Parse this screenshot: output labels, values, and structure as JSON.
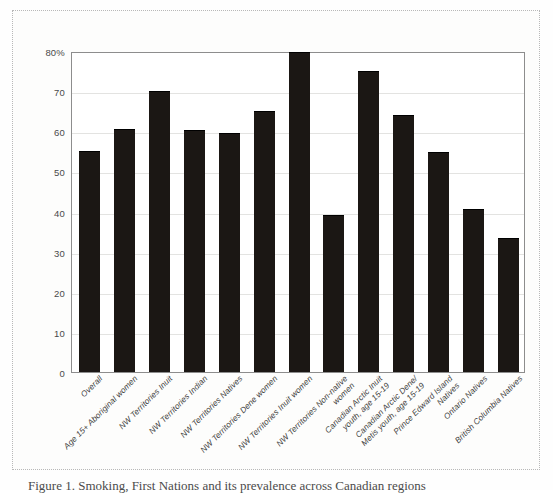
{
  "figure": {
    "caption": "Figure 1. Smoking, First Nations and its prevalence across Canadian regions"
  },
  "chart_data": {
    "type": "bar",
    "title": "",
    "xlabel": "",
    "ylabel": "",
    "ylim": [
      0,
      80
    ],
    "grid": true,
    "legend": "none",
    "bar_color": "#1b1714",
    "y_ticks": [
      0,
      10,
      20,
      30,
      40,
      50,
      60,
      70,
      80
    ],
    "y_tick_labels": [
      "0",
      "10",
      "20",
      "30",
      "40",
      "50",
      "60",
      "70",
      "80%"
    ],
    "categories": [
      "Overall",
      "Age 15+ Aboriginal women",
      "NW Territories Inuit",
      "NW Territories Indian",
      "NW Territories Natives",
      "NW Territories Dene women",
      "NW Territories Inuit women",
      "NW Territories Non-native women",
      "Canadian Arctic Inuit youth, age 15-19",
      "Canadian Arctic Dene/Metis youth, age 15-19",
      "Prince Edward Island Natives",
      "Ontario Natives",
      "British Columbia Natives"
    ],
    "category_lines": [
      [
        "Overall"
      ],
      [
        "Age 15+ Aboriginal women"
      ],
      [
        "NW Territories Inuit"
      ],
      [
        "NW Territories Indian"
      ],
      [
        "NW Territories Natives"
      ],
      [
        "NW Territories Dene women"
      ],
      [
        "NW Territories Inuit women"
      ],
      [
        "NW Territories Non-native",
        "women"
      ],
      [
        "Canadian Arctic Inuit",
        "youth, age 15-19"
      ],
      [
        "Canadian Arctic Dene/",
        "Metis youth, age 15-19"
      ],
      [
        "Prince Edward Island",
        "Natives"
      ],
      [
        "Ontario Natives"
      ],
      [
        "British Columbia Natives"
      ]
    ],
    "values": [
      54.9,
      60.3,
      69.8,
      60.0,
      59.4,
      64.7,
      79.5,
      39.0,
      74.7,
      63.8,
      54.7,
      40.5,
      33.2
    ]
  }
}
